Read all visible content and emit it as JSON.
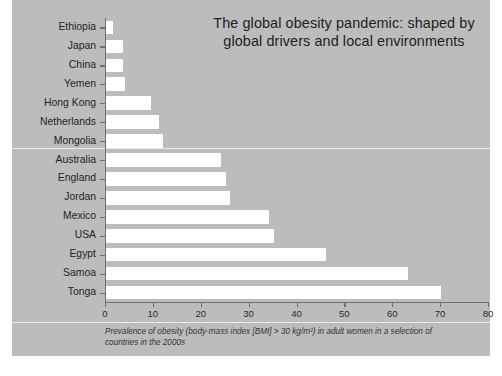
{
  "title": "The global obesity pandemic: shaped by global drivers and local environments",
  "caption_line1": "Prevalence of obesity (body-mass index [BMI] > 30 kg/m²) in adult women in a selection",
  "caption_line2": "of countries in the 2000s",
  "colors": {
    "panel_background": "#bcbcbc",
    "bar_fill": "#ffffff",
    "axis": "#6f6f6f",
    "text": "#232323",
    "page_background": "#ffffff"
  },
  "chart_data": {
    "type": "bar",
    "orientation": "horizontal",
    "title": "The global obesity pandemic: shaped by global drivers and local environments",
    "xlabel": "",
    "ylabel": "",
    "xlim": [
      0,
      80
    ],
    "xticks": [
      0,
      10,
      20,
      30,
      40,
      50,
      60,
      70,
      80
    ],
    "grid": false,
    "legend": false,
    "categories": [
      "Ethiopia",
      "Japan",
      "China",
      "Yemen",
      "Hong Kong",
      "Netherlands",
      "Mongolia",
      "Australia",
      "England",
      "Jordan",
      "Mexico",
      "USA",
      "Egypt",
      "Samoa",
      "Tonga"
    ],
    "values": [
      1.5,
      3.5,
      3.5,
      4,
      9.5,
      11,
      12,
      24,
      25,
      26,
      34,
      35,
      46,
      63,
      70
    ],
    "annotation": "Prevalence of obesity (body-mass index [BMI] > 30 kg/m²) in adult women in a selection of countries in the 2000s"
  }
}
